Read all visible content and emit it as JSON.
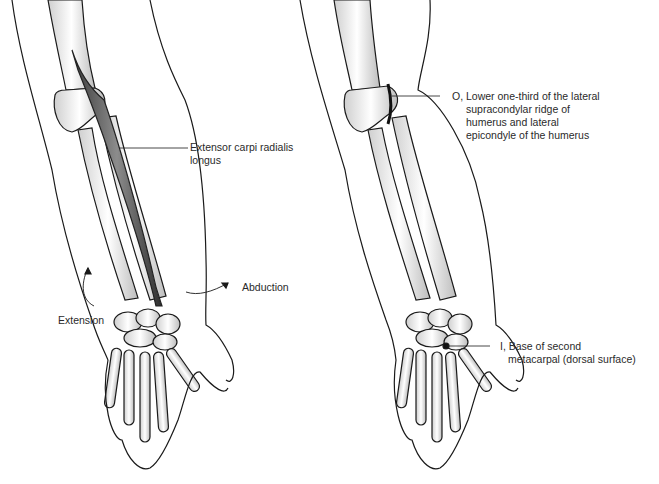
{
  "figure": {
    "left_panel": {
      "muscle_label": {
        "line1": "Extensor carpi radialis",
        "line2": "longus"
      },
      "motion_labels": {
        "abduction": "Abduction",
        "extension": "Extension"
      }
    },
    "right_panel": {
      "origin_label": {
        "line1": "O, Lower one-third of the lateral",
        "line2": "supracondylar ridge of",
        "line3": "humerus and lateral",
        "line4": "epicondyle of the humerus"
      },
      "insertion_label": {
        "line1": "I, Base of second",
        "line2": "metacarpal (dorsal surface)"
      }
    },
    "colors": {
      "line": "#1a1a1a",
      "shade": "#8a8a8a",
      "muscle": "#555555",
      "background": "#ffffff"
    }
  }
}
